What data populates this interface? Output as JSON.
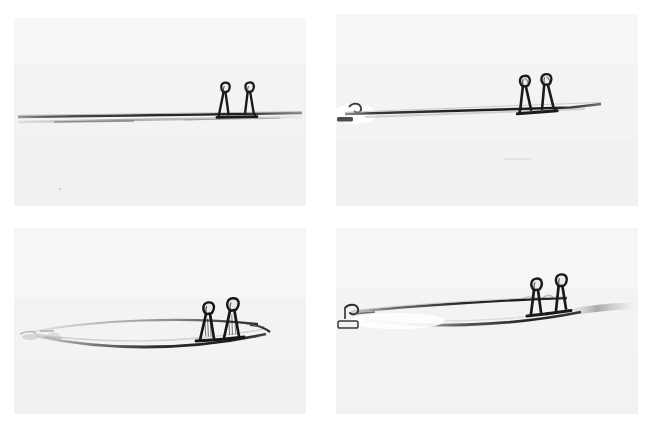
{
  "figure": {
    "kind": "photographic-figure",
    "layout": "2x2 grid of grayscale photographs",
    "background_color": "#ffffff",
    "panel_background_color": "#f2f2f2",
    "ink_color": "#1d1d1d",
    "mid_gray": "#7a7a7a",
    "light_gray": "#b9b9b9",
    "panel_count": 4,
    "panels": [
      {
        "id": "panel-1",
        "position": "top-left",
        "label": "",
        "subject": "thin straight horizontal rod with two wire loop clips near right end",
        "state": "undeflected straight rod",
        "clip_count": 2
      },
      {
        "id": "panel-2",
        "position": "top-right",
        "label": "",
        "subject": "thin rod slightly tilted with two wire loop clips and small clamp at left tip",
        "state": "slightly inclined rod",
        "clip_count": 2
      },
      {
        "id": "panel-3",
        "position": "bottom-left",
        "label": "",
        "subject": "rod bowed into a lens shape with two wire loop clips and mirror reflection",
        "state": "strongly bowed rod",
        "clip_count": 2
      },
      {
        "id": "panel-4",
        "position": "bottom-right",
        "label": "",
        "subject": "rod bowed with clamp hook at left tip, two wire loop clips at right, reflection below",
        "state": "bowed rod with end clamp",
        "clip_count": 2
      }
    ]
  },
  "icons": {
    "clip": "wire-loop-clip-icon",
    "rod": "thin-rod-icon",
    "clamp": "end-clamp-icon"
  }
}
